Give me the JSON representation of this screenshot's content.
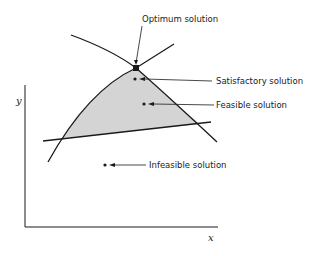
{
  "diagram": {
    "type": "feasible-region-diagram",
    "axes": {
      "x_label": "x",
      "y_label": "y"
    },
    "colors": {
      "line": "#1a1a1a",
      "region_fill": "#d4d4d4",
      "background": "#ffffff"
    },
    "annotations": [
      {
        "id": "optimum",
        "label": "Optimum solution"
      },
      {
        "id": "satisfactory",
        "label": "Satisfactory solution"
      },
      {
        "id": "feasible",
        "label": "Feasible solution"
      },
      {
        "id": "infeasible",
        "label": "Infeasible solution"
      }
    ]
  }
}
